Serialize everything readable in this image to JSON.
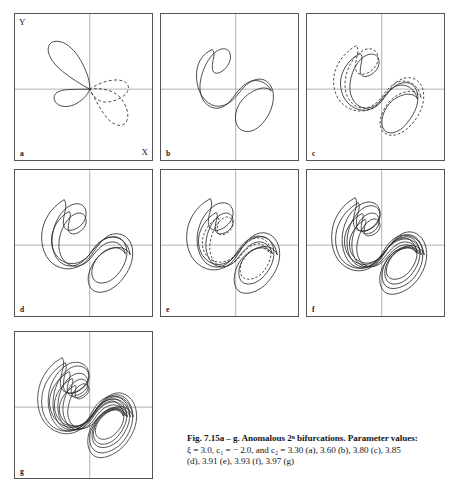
{
  "figure": {
    "label": "Fig. 7.15",
    "panel_range": "a – g",
    "axis_labels": {
      "y": "Y",
      "x": "X"
    },
    "caption_lines": [
      "Fig. 7.15a – g. Anomalous 2ⁿ bifurcations. Parameter values:",
      "ξ = 3.0, c₁ = − 2.0, and c₂ = 3.30 (a), 3.60 (b), 3.80 (c), 3.85",
      "(d), 3.91 (e), 3.93 (f), 3.97 (g)"
    ],
    "caption_title_bold": "Fig. 7.15a – g.",
    "caption_body": "Anomalous 2ⁿ bifurcations. Parameter values:",
    "parameters": {
      "xi_label": "ξ",
      "xi_value": "3.0",
      "c1_label": "c₁",
      "c1_value": "− 2.0",
      "c2_label": "c₂",
      "c2_values": [
        {
          "panel": "a",
          "value": "3.30"
        },
        {
          "panel": "b",
          "value": "3.60"
        },
        {
          "panel": "c",
          "value": "3.80"
        },
        {
          "panel": "d",
          "value": "3.85"
        },
        {
          "panel": "e",
          "value": "3.91"
        },
        {
          "panel": "f",
          "value": "3.93"
        },
        {
          "panel": "g",
          "value": "3.97"
        }
      ]
    },
    "panels": [
      {
        "id": "a",
        "letter": "a",
        "c2": "3.30",
        "description": "two-lobe figure-eight, solid left lobe and dashed right lobe"
      },
      {
        "id": "b",
        "letter": "b",
        "c2": "3.60",
        "description": "single continuous figure-eight orbit"
      },
      {
        "id": "c",
        "letter": "c",
        "c2": "3.80",
        "description": "period-doubled orbit, solid plus dashed companion"
      },
      {
        "id": "d",
        "letter": "d",
        "c2": "3.85",
        "description": "period-2 orbit, two nested solid loops"
      },
      {
        "id": "e",
        "letter": "e",
        "c2": "3.91",
        "description": "period-2 orbit with dashed companion strands"
      },
      {
        "id": "f",
        "letter": "f",
        "c2": "3.93",
        "description": "period-4 orbit, multiple bundled strands"
      },
      {
        "id": "g",
        "letter": "g",
        "c2": "3.97",
        "description": "period-8 orbit, dense bundle of strands"
      }
    ],
    "colors": {
      "curve": "#2a2a2e",
      "frame": "#55545a",
      "grid": "#8e8d93",
      "background": "#ffffff",
      "text": "#151518"
    },
    "grid": {
      "x_fraction": 0.545,
      "y_fraction": 0.515
    }
  }
}
